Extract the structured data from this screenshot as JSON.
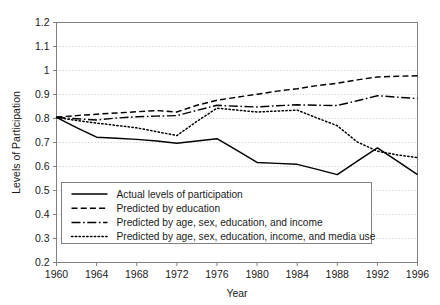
{
  "chart_data": {
    "type": "line",
    "title": "",
    "xlabel": "Year",
    "ylabel": "Levels of Participation",
    "xlim": [
      1960,
      1996
    ],
    "ylim": [
      0.2,
      1.2
    ],
    "ytick_step": 0.1,
    "xtick_step": 4,
    "grid": "horizontal-dotted",
    "legend_position": "lower-left-inside",
    "xticks": [
      "1960",
      "1964",
      "1968",
      "1972",
      "1976",
      "1980",
      "1984",
      "1988",
      "1992",
      "1996"
    ],
    "yticks": [
      "0.2",
      "0.3",
      "0.4",
      "0.5",
      "0.6",
      "0.7",
      "0.8",
      "0.9",
      "1",
      "1.1",
      "1.2"
    ],
    "x": [
      1960,
      1962,
      1964,
      1966,
      1968,
      1970,
      1972,
      1974,
      1976,
      1978,
      1980,
      1982,
      1984,
      1986,
      1988,
      1990,
      1992,
      1994,
      1996
    ],
    "series": [
      {
        "name": "Actual levels of participation",
        "style": "solid",
        "color": "#000000",
        "values": [
          0.805,
          0.762,
          0.722,
          0.718,
          0.713,
          0.706,
          0.697,
          0.706,
          0.716,
          0.667,
          0.617,
          0.613,
          0.609,
          0.588,
          0.566,
          0.622,
          0.678,
          0.622,
          0.566
        ]
      },
      {
        "name": "Predicted by education",
        "style": "dashed",
        "color": "#000000",
        "values": [
          0.806,
          0.812,
          0.818,
          0.823,
          0.828,
          0.833,
          0.827,
          0.855,
          0.876,
          0.889,
          0.901,
          0.914,
          0.924,
          0.937,
          0.947,
          0.961,
          0.973,
          0.976,
          0.978
        ]
      },
      {
        "name": "Predicted by age, sex, education, and income",
        "style": "dashdot",
        "color": "#000000",
        "values": [
          0.805,
          0.799,
          0.794,
          0.802,
          0.807,
          0.81,
          0.812,
          0.834,
          0.855,
          0.851,
          0.848,
          0.853,
          0.857,
          0.855,
          0.854,
          0.874,
          0.895,
          0.889,
          0.883
        ]
      },
      {
        "name": "Predicted by age, sex, education, income, and media use",
        "style": "dotted",
        "color": "#000000",
        "values": [
          0.804,
          0.792,
          0.781,
          0.771,
          0.761,
          0.745,
          0.729,
          0.788,
          0.843,
          0.835,
          0.827,
          0.831,
          0.835,
          0.802,
          0.77,
          0.702,
          0.664,
          0.648,
          0.637
        ]
      }
    ]
  },
  "legend": {
    "items": [
      {
        "label": "Actual levels of participation",
        "style": "solid"
      },
      {
        "label": "Predicted by education",
        "style": "dashed"
      },
      {
        "label": "Predicted by age, sex, education, and income",
        "style": "dashdot"
      },
      {
        "label": "Predicted by age, sex, education, income, and media use",
        "style": "dotted"
      }
    ]
  },
  "colors": {
    "line": "#000000",
    "axis": "#808080",
    "grid": "#c8c8c8",
    "background": "#ffffff",
    "legend_border": "#808080"
  }
}
